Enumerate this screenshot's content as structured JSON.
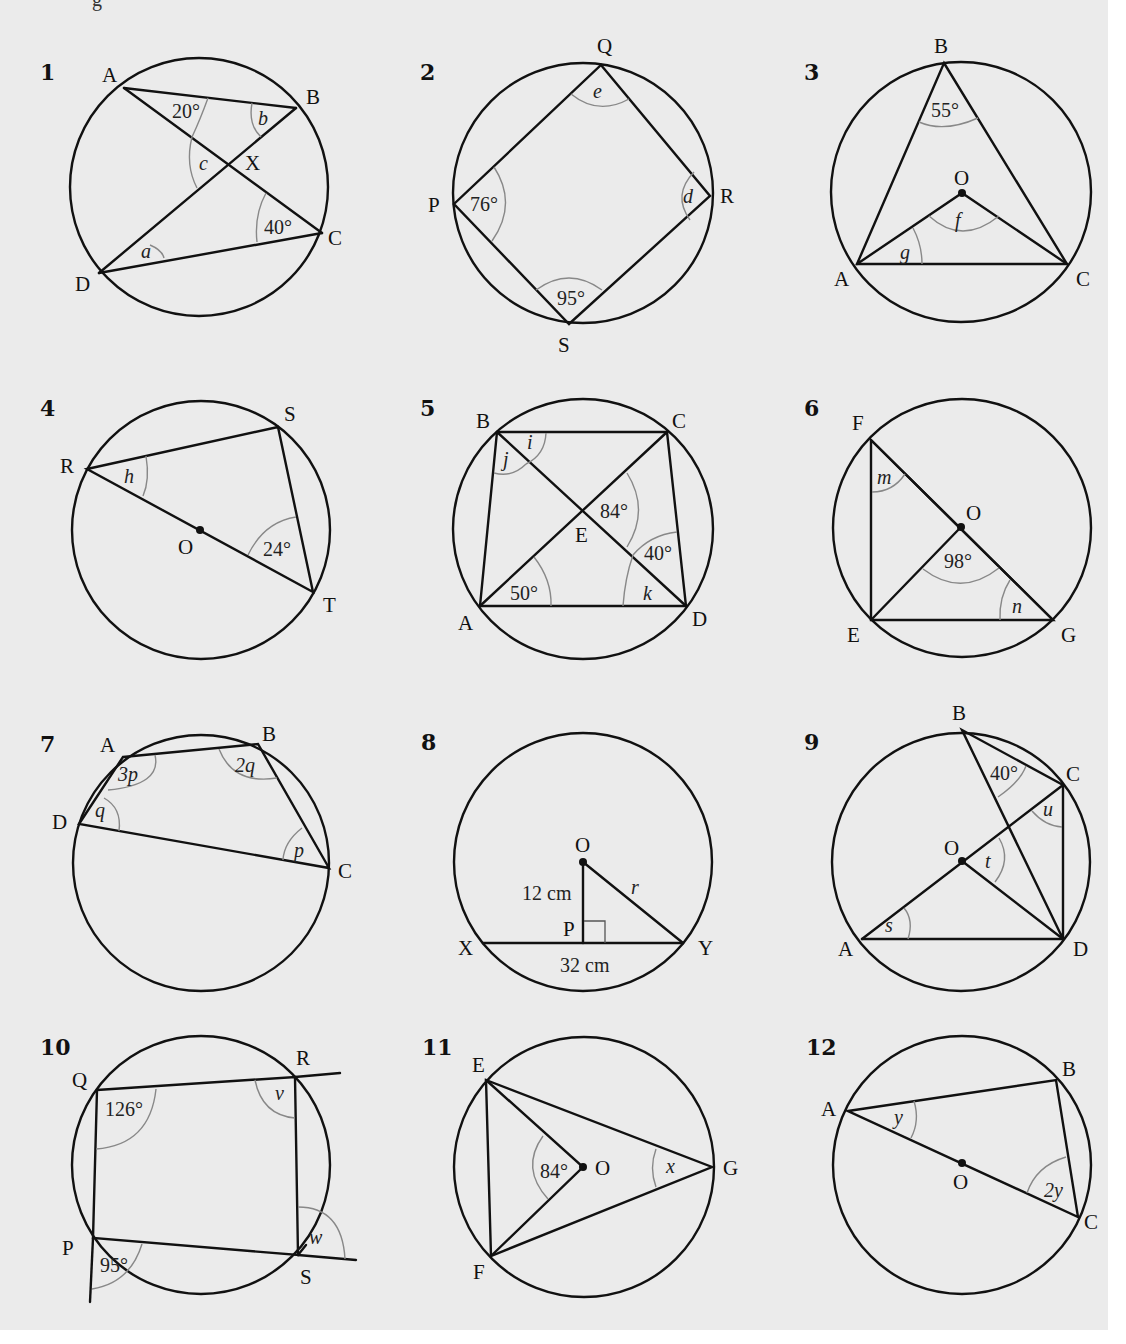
{
  "page": {
    "background": "#ebebeb",
    "line_color": "#111111",
    "arc_color": "#888888",
    "top_cut_text": "g"
  },
  "diagrams": [
    {
      "number": "1",
      "points": {
        "A": "A",
        "B": "B",
        "C": "C",
        "D": "D",
        "X": "X"
      },
      "angles": {
        "at_A": "20°",
        "at_C": "40°"
      },
      "unknowns": {
        "a": "a",
        "b": "b",
        "c": "c"
      }
    },
    {
      "number": "2",
      "points": {
        "P": "P",
        "Q": "Q",
        "R": "R",
        "S": "S"
      },
      "angles": {
        "at_P": "76°",
        "at_S": "95°"
      },
      "unknowns": {
        "d": "d",
        "e": "e"
      }
    },
    {
      "number": "3",
      "points": {
        "A": "A",
        "B": "B",
        "C": "C",
        "O": "O"
      },
      "angles": {
        "at_B": "55°"
      },
      "unknowns": {
        "f": "f",
        "g": "g"
      }
    },
    {
      "number": "4",
      "points": {
        "R": "R",
        "S": "S",
        "T": "T",
        "O": "O"
      },
      "angles": {
        "at_T": "24°"
      },
      "unknowns": {
        "h": "h"
      }
    },
    {
      "number": "5",
      "points": {
        "A": "A",
        "B": "B",
        "C": "C",
        "D": "D",
        "E": "E"
      },
      "angles": {
        "at_E": "84°",
        "at_D_upper": "40°",
        "at_A": "50°"
      },
      "unknowns": {
        "i": "i",
        "j": "j",
        "k": "k"
      }
    },
    {
      "number": "6",
      "points": {
        "E": "E",
        "F": "F",
        "G": "G",
        "O": "O"
      },
      "angles": {
        "at_O": "98°"
      },
      "unknowns": {
        "m": "m",
        "n": "n"
      }
    },
    {
      "number": "7",
      "points": {
        "A": "A",
        "B": "B",
        "C": "C",
        "D": "D"
      },
      "angles": {},
      "unknowns": {
        "at_A": "3p",
        "at_B": "2q",
        "at_C": "p",
        "at_D": "q"
      }
    },
    {
      "number": "8",
      "points": {
        "O": "O",
        "P": "P",
        "X": "X",
        "Y": "Y"
      },
      "lengths": {
        "OP": "12 cm",
        "XY": "32 cm"
      },
      "unknowns": {
        "r": "r"
      }
    },
    {
      "number": "9",
      "points": {
        "A": "A",
        "B": "B",
        "C": "C",
        "D": "D",
        "O": "O"
      },
      "angles": {
        "at_B": "40°"
      },
      "unknowns": {
        "s": "s",
        "t": "t",
        "u": "u"
      }
    },
    {
      "number": "10",
      "points": {
        "P": "P",
        "Q": "Q",
        "R": "R",
        "S": "S"
      },
      "angles": {
        "at_Q": "126°",
        "at_P_ext": "95°"
      },
      "unknowns": {
        "v": "v",
        "w": "w"
      }
    },
    {
      "number": "11",
      "points": {
        "E": "E",
        "F": "F",
        "G": "G",
        "O": "O"
      },
      "angles": {
        "at_O": "84°"
      },
      "unknowns": {
        "x": "x"
      }
    },
    {
      "number": "12",
      "points": {
        "A": "A",
        "B": "B",
        "C": "C",
        "O": "O"
      },
      "angles": {},
      "unknowns": {
        "at_A": "y",
        "at_C": "2y"
      }
    }
  ]
}
